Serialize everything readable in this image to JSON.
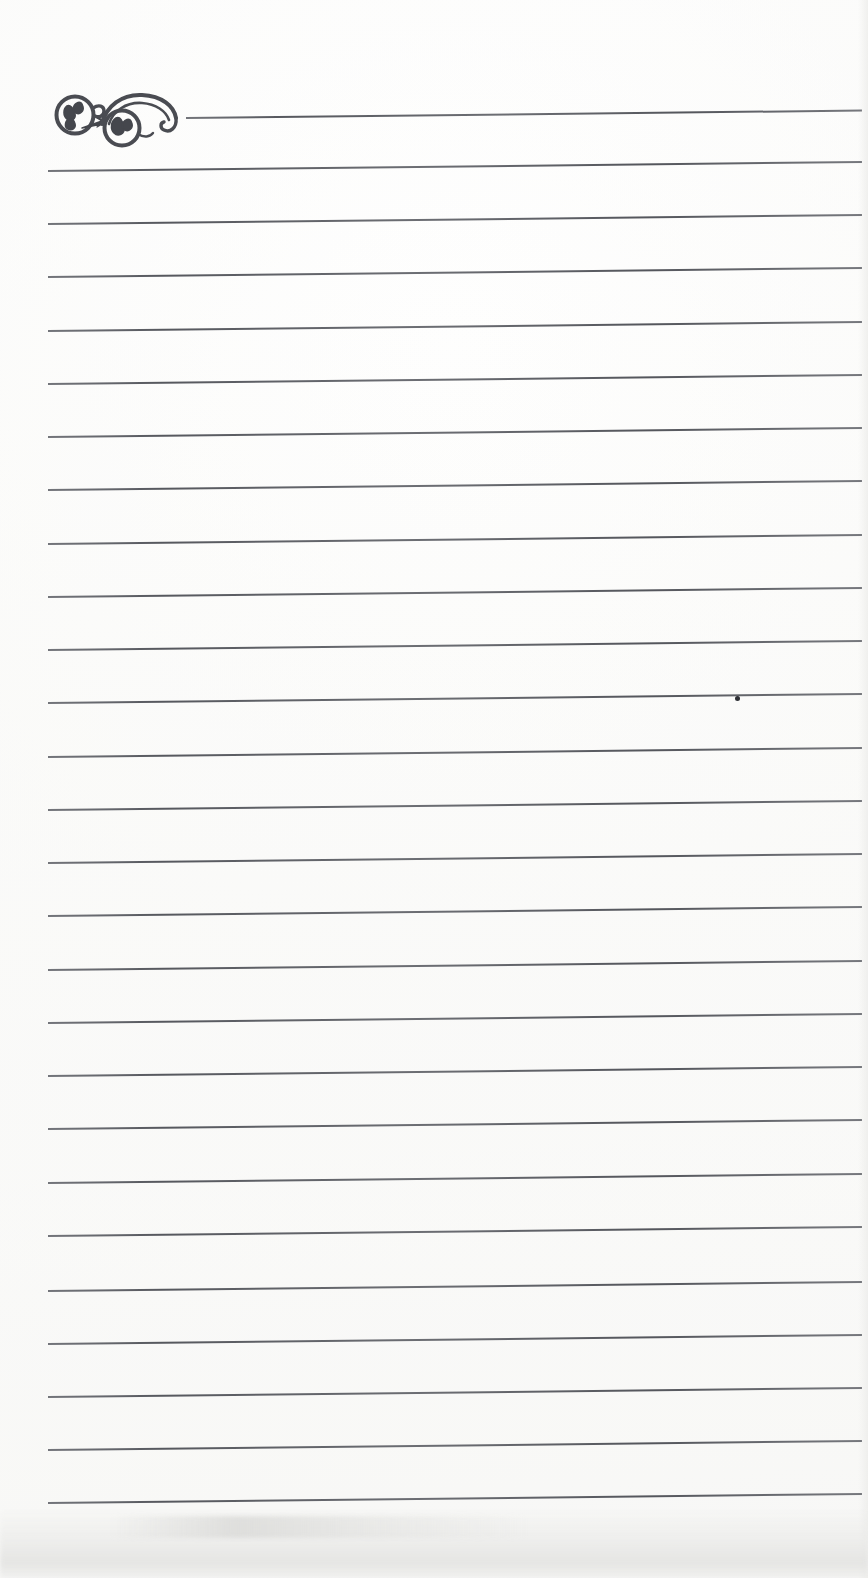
{
  "document": {
    "kind": "scanned-lined-notepaper",
    "page_width": 868,
    "page_height": 1578,
    "background_color": "#fdfdfc",
    "content_text": "",
    "is_blank": true
  },
  "ornament": {
    "name": "calligraphic-flourish",
    "description": "Double-spiral scroll flourish with leaf curls, drawn in dark ink at the top-left of the sheet",
    "color": "#4a4c52",
    "x": 50,
    "y": 88,
    "width": 140,
    "height": 66
  },
  "rules": {
    "color": "#5a5c62",
    "thickness": 2,
    "count": 27,
    "left_x": 48,
    "right_x": 862,
    "first_line_left_x": 186,
    "spacing": 53.3,
    "tilt_rise_px": 9,
    "lines": [
      {
        "index": 1,
        "y": 117,
        "left_x": 186,
        "right_x": 862
      },
      {
        "index": 2,
        "y": 170,
        "left_x": 48,
        "right_x": 862
      },
      {
        "index": 3,
        "y": 223,
        "left_x": 48,
        "right_x": 862
      },
      {
        "index": 4,
        "y": 276,
        "left_x": 48,
        "right_x": 862
      },
      {
        "index": 5,
        "y": 330,
        "left_x": 48,
        "right_x": 862
      },
      {
        "index": 6,
        "y": 383,
        "left_x": 48,
        "right_x": 862
      },
      {
        "index": 7,
        "y": 436,
        "left_x": 48,
        "right_x": 862
      },
      {
        "index": 8,
        "y": 489,
        "left_x": 48,
        "right_x": 862
      },
      {
        "index": 9,
        "y": 543,
        "left_x": 48,
        "right_x": 862
      },
      {
        "index": 10,
        "y": 596,
        "left_x": 48,
        "right_x": 862
      },
      {
        "index": 11,
        "y": 649,
        "left_x": 48,
        "right_x": 862
      },
      {
        "index": 12,
        "y": 702,
        "left_x": 48,
        "right_x": 862
      },
      {
        "index": 13,
        "y": 756,
        "left_x": 48,
        "right_x": 862
      },
      {
        "index": 14,
        "y": 809,
        "left_x": 48,
        "right_x": 862
      },
      {
        "index": 15,
        "y": 862,
        "left_x": 48,
        "right_x": 862
      },
      {
        "index": 16,
        "y": 915,
        "left_x": 48,
        "right_x": 862
      },
      {
        "index": 17,
        "y": 969,
        "left_x": 48,
        "right_x": 862
      },
      {
        "index": 18,
        "y": 1022,
        "left_x": 48,
        "right_x": 862
      },
      {
        "index": 19,
        "y": 1075,
        "left_x": 48,
        "right_x": 862
      },
      {
        "index": 20,
        "y": 1128,
        "left_x": 48,
        "right_x": 862
      },
      {
        "index": 21,
        "y": 1182,
        "left_x": 48,
        "right_x": 862
      },
      {
        "index": 22,
        "y": 1235,
        "left_x": 48,
        "right_x": 862
      },
      {
        "index": 23,
        "y": 1290,
        "left_x": 48,
        "right_x": 862
      },
      {
        "index": 24,
        "y": 1343,
        "left_x": 48,
        "right_x": 862
      },
      {
        "index": 25,
        "y": 1396,
        "left_x": 48,
        "right_x": 862
      },
      {
        "index": 26,
        "y": 1449,
        "left_x": 48,
        "right_x": 862
      },
      {
        "index": 27,
        "y": 1502,
        "left_x": 48,
        "right_x": 862
      }
    ]
  },
  "artifacts": {
    "ink_dot": {
      "name": "ink-dot",
      "x": 735,
      "y": 696,
      "color": "#2f3136"
    },
    "bottom_smudge": {
      "name": "bottom-smudge",
      "y": 1508,
      "height": 70,
      "color": "#e8e8e6"
    }
  }
}
